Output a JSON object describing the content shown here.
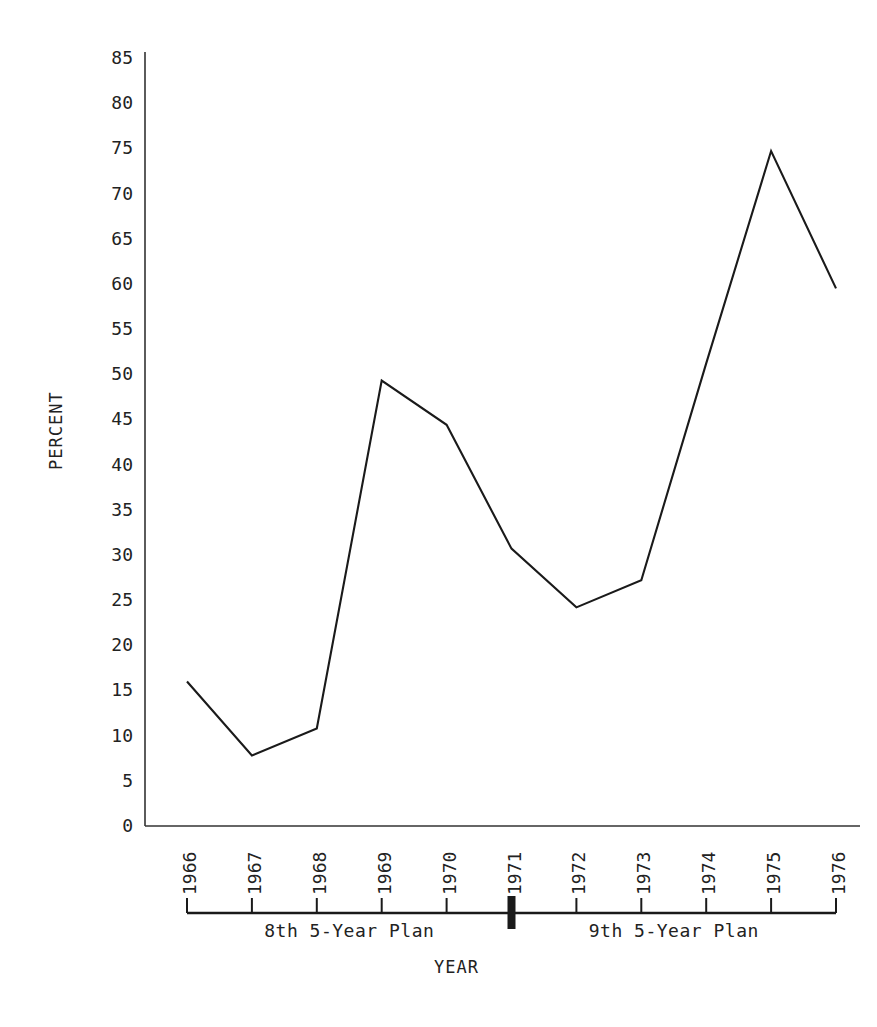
{
  "chart_data": {
    "type": "line",
    "title": "",
    "xlabel": "YEAR",
    "ylabel": "PERCENT",
    "x": [
      1966,
      1967,
      1968,
      1969,
      1970,
      1971,
      1972,
      1973,
      1974,
      1975,
      1976
    ],
    "categories": [
      "1966",
      "1967",
      "1968",
      "1969",
      "1970",
      "1971",
      "1972",
      "1973",
      "1974",
      "1975",
      "1976"
    ],
    "values": [
      16.0,
      7.8,
      10.8,
      49.3,
      44.4,
      30.7,
      24.2,
      27.2,
      51.2,
      74.7,
      59.5
    ],
    "series": [
      {
        "name": "Percent",
        "values": [
          16.0,
          7.8,
          10.8,
          49.3,
          44.4,
          30.7,
          24.2,
          27.2,
          51.2,
          74.7,
          59.5
        ]
      }
    ],
    "ylim": [
      0,
      85
    ],
    "yticks": [
      0,
      5,
      10,
      15,
      20,
      25,
      30,
      35,
      40,
      45,
      50,
      55,
      60,
      65,
      70,
      75,
      80,
      85
    ],
    "ytick_labels": [
      "0",
      "5",
      "10",
      "15",
      "20",
      "25",
      "30",
      "35",
      "40",
      "45",
      "50",
      "55",
      "60",
      "65",
      "70",
      "75",
      "80",
      "85"
    ],
    "grid": false,
    "legend": "none",
    "line_color": "#1a1a1a",
    "axis_color": "#333333"
  },
  "axes": {
    "y_title": "PERCENT",
    "x_title": "YEAR"
  },
  "timeline": {
    "divider_year": "1971",
    "periods": [
      {
        "label": "8th 5-Year Plan",
        "start_year": "1966",
        "end_year": "1971"
      },
      {
        "label": "9th 5-Year Plan",
        "start_year": "1971",
        "end_year": "1976"
      }
    ]
  }
}
